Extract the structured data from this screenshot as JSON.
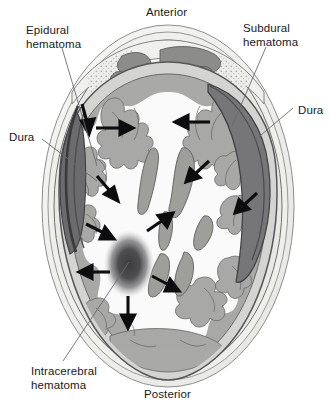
{
  "figure": {
    "type": "axial-head-cross-section",
    "width": 331,
    "height": 409,
    "background": "#ffffff"
  },
  "orientation": {
    "anterior": "Anterior",
    "posterior": "Posterior"
  },
  "labels": [
    {
      "id": "epidural",
      "text": "Epidural\nhematoma",
      "x": 26,
      "y": 24,
      "align": "left"
    },
    {
      "id": "subdural",
      "text": "Subdural\nhematoma",
      "x": 243,
      "y": 22,
      "align": "left"
    },
    {
      "id": "dura_right",
      "text": "Dura",
      "x": 298,
      "y": 104,
      "align": "left"
    },
    {
      "id": "dura_left",
      "text": "Dura",
      "x": 9,
      "y": 131,
      "align": "left"
    },
    {
      "id": "intracerebral",
      "text": "Intracerebral\nhematoma",
      "x": 31,
      "y": 365,
      "align": "left"
    }
  ],
  "colors": {
    "scalp_outer": "#f4f4f2",
    "scalp_inner": "#e9e9e6",
    "skull_bone": "#ededea",
    "diploe_stipple": "#b6b6b4",
    "dura_line": "#56565a",
    "csf_space": "#d2d2d0",
    "gray_matter": "#a9a9a7",
    "white_matter": "#fafafa",
    "ventricle": "#9e9e9c",
    "epidural_hematoma": "#6b6b6e",
    "subdural_hematoma": "#767678",
    "intracerebral_hematoma": "#4a4a4c",
    "arrow": "#0d0d0f",
    "leader_line": "#6b6b70",
    "text": "#19191b"
  },
  "pathology": {
    "epidural": {
      "name": "Epidural hematoma",
      "location": "left lateral, between skull and dura",
      "shape": "biconvex lens",
      "fill": "#6b6b6e"
    },
    "subdural": {
      "name": "Subdural hematoma",
      "location": "right lateral, between dura and arachnoid",
      "shape": "crescent",
      "fill": "#767678"
    },
    "intracerebral": {
      "name": "Intracerebral hematoma",
      "location": "left posterior white matter",
      "shape": "blurred ovoid",
      "fill": "#4a4a4c"
    }
  },
  "arrows": [
    {
      "id": "a1",
      "x1": 96,
      "y1": 128,
      "x2": 125,
      "y2": 128,
      "note": "left frontal midline shift"
    },
    {
      "id": "a2",
      "x1": 210,
      "y1": 122,
      "x2": 182,
      "y2": 122,
      "note": "right frontal mass effect"
    },
    {
      "id": "a3",
      "x1": 82,
      "y1": 105,
      "x2": 88,
      "y2": 125,
      "note": "epidural compression inward"
    },
    {
      "id": "a4",
      "x1": 98,
      "y1": 177,
      "x2": 113,
      "y2": 194,
      "note": "left lateral compression"
    },
    {
      "id": "a5",
      "x1": 208,
      "y1": 162,
      "x2": 192,
      "y2": 176,
      "note": "right subdural compression"
    },
    {
      "id": "a6",
      "x1": 256,
      "y1": 194,
      "x2": 241,
      "y2": 208,
      "note": "right posterolateral compression"
    },
    {
      "id": "a7",
      "x1": 88,
      "y1": 225,
      "x2": 108,
      "y2": 235,
      "note": "left compression toward midline"
    },
    {
      "id": "a8",
      "x1": 148,
      "y1": 230,
      "x2": 168,
      "y2": 216,
      "note": "central displacement"
    },
    {
      "id": "a9",
      "x1": 86,
      "y1": 272,
      "x2": 109,
      "y2": 272,
      "note": "intracerebral lateral expansion"
    },
    {
      "id": "a10",
      "x1": 152,
      "y1": 276,
      "x2": 175,
      "y2": 288,
      "note": "intracerebral posterolateral expansion"
    },
    {
      "id": "a11",
      "x1": 128,
      "y1": 296,
      "x2": 128,
      "y2": 320,
      "note": "intracerebral posterior expansion"
    }
  ],
  "leaders": [
    {
      "id": "epidural-leader",
      "points": "62,48 96,165"
    },
    {
      "id": "subdural-leader",
      "points": "266,48 233,125"
    },
    {
      "id": "dura-right-leader",
      "points": "295,108 255,140"
    },
    {
      "id": "dura-left-leader",
      "points": "41,140 96,180"
    },
    {
      "id": "intracerebral-leader",
      "points": "62,362 128,262"
    }
  ]
}
